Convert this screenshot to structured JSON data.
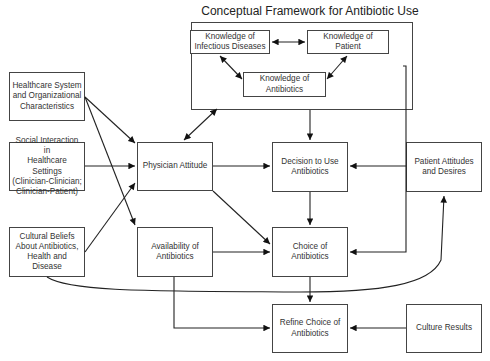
{
  "title": "Conceptual Framework for Antibiotic Use",
  "nodes": {
    "knowledge_infectious": "Knowledge of\nInfectious Diseases",
    "knowledge_patient": "Knowledge of Patient",
    "knowledge_antibiotics": "Knowledge of\nAntibiotics",
    "healthcare_system": "Healthcare System\nand Organizational\nCharacteristics",
    "social_interaction": "Social Interaction in\nHealthcare Settings\n(Clinician-Clinician;\nClinician-Patient)",
    "cultural_beliefs": "Cultural Beliefs\nAbout Antibiotics,\nHealth and Disease",
    "physician_attitude": "Physician Attitude",
    "availability": "Availability of\nAntibiotics",
    "decision": "Decision to Use\nAntibiotics",
    "choice": "Choice of\nAntibiotics",
    "refine": "Refine Choice of\nAntibiotics",
    "patient_attitudes": "Patient Attitudes\nand Desires",
    "culture_results": "Culture Results"
  },
  "edges": [
    {
      "from": "knowledge_infectious",
      "to": "knowledge_patient",
      "bidirectional": true
    },
    {
      "from": "knowledge_infectious",
      "to": "knowledge_antibiotics",
      "bidirectional": true
    },
    {
      "from": "knowledge_patient",
      "to": "knowledge_antibiotics",
      "bidirectional": true
    },
    {
      "from": "knowledge_group",
      "to": "physician_attitude",
      "bidirectional": true
    },
    {
      "from": "knowledge_group",
      "to": "decision"
    },
    {
      "from": "knowledge_group",
      "to": "choice"
    },
    {
      "from": "healthcare_system",
      "to": "physician_attitude"
    },
    {
      "from": "healthcare_system",
      "to": "availability"
    },
    {
      "from": "social_interaction",
      "to": "physician_attitude"
    },
    {
      "from": "cultural_beliefs",
      "to": "physician_attitude"
    },
    {
      "from": "cultural_beliefs",
      "to": "patient_attitudes"
    },
    {
      "from": "physician_attitude",
      "to": "decision"
    },
    {
      "from": "physician_attitude",
      "to": "choice"
    },
    {
      "from": "availability",
      "to": "choice"
    },
    {
      "from": "availability",
      "to": "refine"
    },
    {
      "from": "patient_attitudes",
      "to": "decision"
    },
    {
      "from": "decision",
      "to": "choice"
    },
    {
      "from": "choice",
      "to": "refine"
    },
    {
      "from": "culture_results",
      "to": "refine"
    }
  ]
}
